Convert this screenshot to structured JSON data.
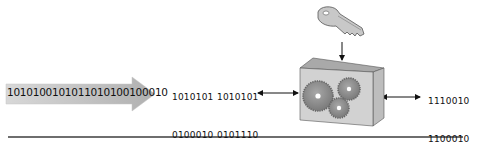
{
  "diagram": {
    "input_stream": {
      "label": "1010100101011010100100010",
      "icon": "data-stream-arrow"
    },
    "plaintext_block": {
      "columns": [
        [
          "1010101",
          "0100010",
          "1010010",
          "1010101"
        ],
        [
          "1010101",
          "0101110",
          "1010010",
          "1011101"
        ]
      ]
    },
    "cipher_engine": {
      "icon": "gear-box-icon",
      "key_icon": "key-icon"
    },
    "ciphertext_block": {
      "columns": [
        [
          "1110010",
          "1100010",
          "1011001",
          "1010101"
        ]
      ]
    },
    "colors": {
      "stream_fill": "#b9b9b9",
      "box_front": "#cfcfcf",
      "box_top": "#a9a9a9",
      "box_side": "#bdbdbd",
      "gear": "#8c8c8c",
      "rule": "#6e6e6e"
    }
  }
}
